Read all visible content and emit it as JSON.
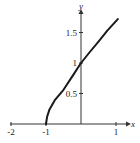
{
  "chart_data": {
    "type": "line",
    "title": "",
    "xlabel": "x",
    "ylabel": "y",
    "xlim": [
      -2,
      1.2
    ],
    "ylim": [
      0,
      1.85
    ],
    "grid": false,
    "legend": null,
    "x_ticks": [
      {
        "value": -2,
        "label": "-2"
      },
      {
        "value": -1,
        "label": "-1"
      },
      {
        "value": 1,
        "label": "1"
      }
    ],
    "y_ticks": [
      {
        "value": 0.5,
        "label": "0.5"
      },
      {
        "value": 1,
        "label": "1"
      },
      {
        "value": 1.5,
        "label": "1.5"
      }
    ],
    "series": [
      {
        "name": "curve",
        "color": "#1a1a1a",
        "x": [
          -1.0,
          -0.97,
          -0.9,
          -0.75,
          -0.5,
          -0.25,
          0.0,
          0.25,
          0.5,
          0.75,
          1.05
        ],
        "y": [
          0.0,
          0.12,
          0.24,
          0.39,
          0.56,
          0.78,
          1.0,
          1.18,
          1.35,
          1.53,
          1.72
        ]
      }
    ]
  }
}
